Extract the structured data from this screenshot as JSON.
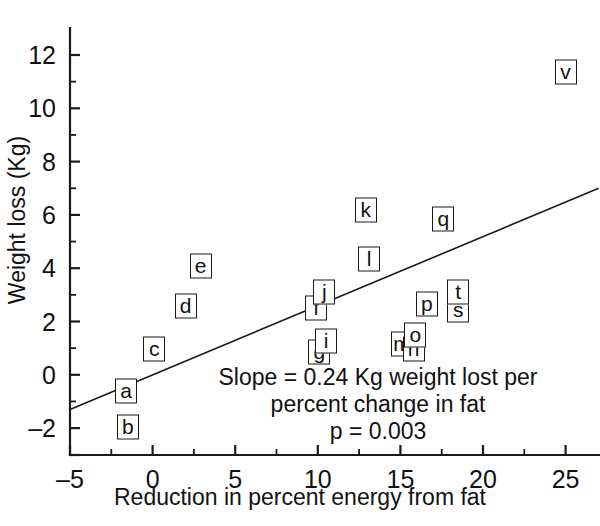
{
  "chart_data": {
    "type": "scatter",
    "title": "",
    "xlabel": "Reduction in percent energy from fat",
    "ylabel": "Weight loss (Kg)",
    "xlim": [
      -5,
      27
    ],
    "ylim": [
      -3,
      12.8
    ],
    "xticks": [
      -5,
      0,
      5,
      10,
      15,
      20,
      25
    ],
    "xtick_labels": [
      "–5",
      "0",
      "5",
      "10",
      "15",
      "20",
      "25"
    ],
    "yticks": [
      -2,
      0,
      2,
      4,
      6,
      8,
      10,
      12
    ],
    "ytick_labels": [
      "–2",
      "0",
      "2",
      "4",
      "6",
      "8",
      "10",
      "12"
    ],
    "minor_xticks": [
      -2.5,
      2.5,
      7.5,
      12.5,
      17.5,
      22.5
    ],
    "minor_yticks": [
      -1,
      1,
      3,
      5,
      7,
      9,
      11
    ],
    "grid": false,
    "legend": false,
    "marker_style": "boxed-letter",
    "points": [
      {
        "label": "a",
        "x": -1.6,
        "y": -0.6
      },
      {
        "label": "b",
        "x": -1.5,
        "y": -1.95
      },
      {
        "label": "c",
        "x": 0.1,
        "y": 0.95
      },
      {
        "label": "d",
        "x": 2.0,
        "y": 2.6
      },
      {
        "label": "e",
        "x": 2.9,
        "y": 4.1
      },
      {
        "label": "f",
        "x": 9.9,
        "y": 2.5
      },
      {
        "label": "g",
        "x": 10.1,
        "y": 0.85
      },
      {
        "label": "i",
        "x": 10.5,
        "y": 1.25
      },
      {
        "label": "j",
        "x": 10.4,
        "y": 3.1
      },
      {
        "label": "k",
        "x": 12.9,
        "y": 6.2
      },
      {
        "label": "l",
        "x": 13.1,
        "y": 4.35
      },
      {
        "label": "m",
        "x": 15.1,
        "y": 1.15
      },
      {
        "label": "n",
        "x": 15.8,
        "y": 0.95
      },
      {
        "label": "o",
        "x": 15.9,
        "y": 1.5
      },
      {
        "label": "p",
        "x": 16.6,
        "y": 2.65
      },
      {
        "label": "q",
        "x": 17.6,
        "y": 5.85
      },
      {
        "label": "s",
        "x": 18.5,
        "y": 2.45
      },
      {
        "label": "t",
        "x": 18.5,
        "y": 3.1
      },
      {
        "label": "v",
        "x": 25.0,
        "y": 11.35
      }
    ],
    "regression": {
      "slope": 0.24,
      "x_start": -5,
      "y_start": -1.3,
      "x_end": 27,
      "y_end": 7.0
    },
    "annotation": {
      "line1": "Slope = 0.24 Kg weight lost per",
      "line2": "percent change in fat",
      "line3": "p = 0.003"
    }
  }
}
